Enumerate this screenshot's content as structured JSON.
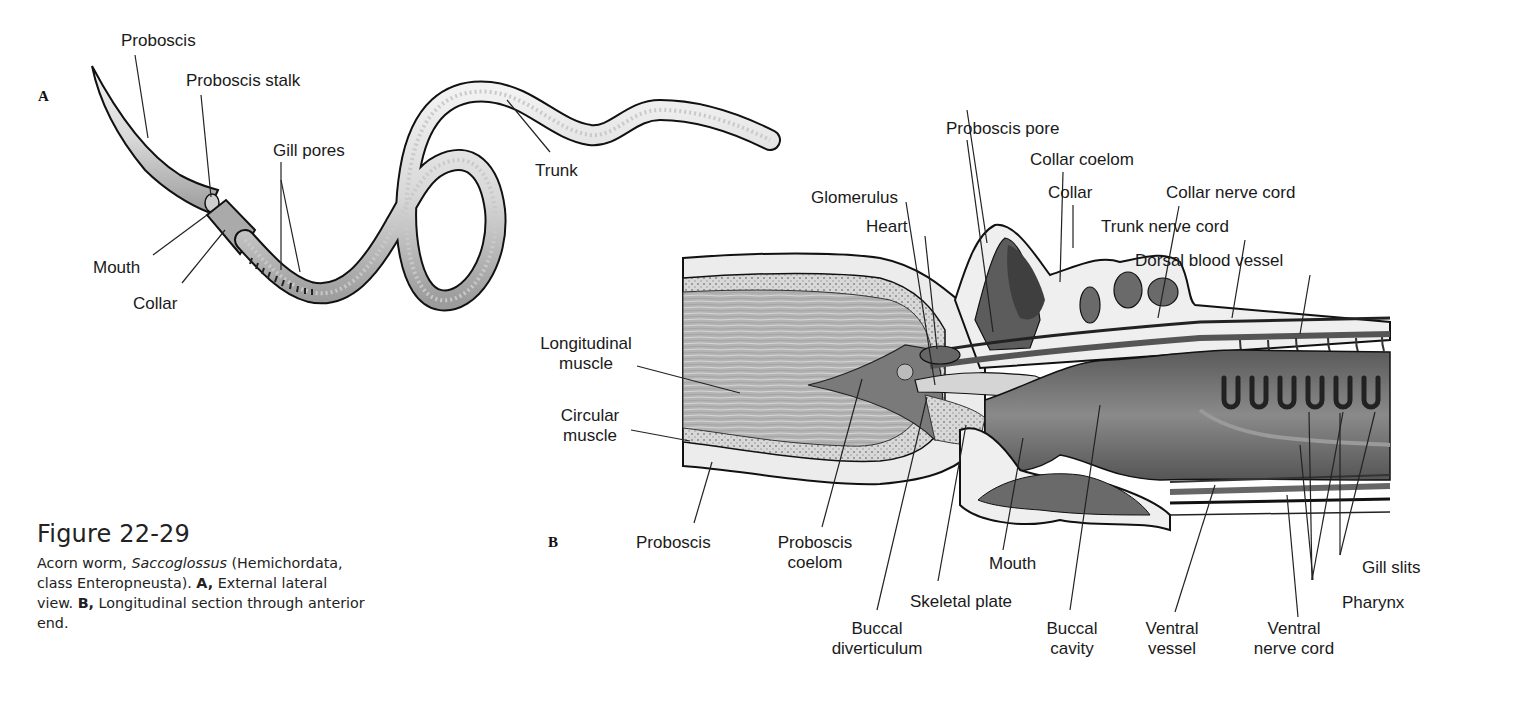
{
  "figure": {
    "number": "Figure 22-29",
    "caption": {
      "lead": "Acorn worm, ",
      "genus": "Saccoglossus",
      "after_genus": " (Hemichordata, class Enteropneusta). ",
      "part_a_marker": "A,",
      "part_a_text": " External lateral view. ",
      "part_b_marker": "B,",
      "part_b_text": " Longitudinal section through anterior end."
    }
  },
  "panel_a": {
    "letter": "A",
    "title": "External lateral view",
    "labels": [
      {
        "id": "proboscis",
        "text": "Proboscis"
      },
      {
        "id": "proboscis-stalk",
        "text": "Proboscis stalk"
      },
      {
        "id": "gill-pores",
        "text": "Gill pores"
      },
      {
        "id": "trunk",
        "text": "Trunk"
      },
      {
        "id": "mouth",
        "text": "Mouth"
      },
      {
        "id": "collar",
        "text": "Collar"
      }
    ]
  },
  "panel_b": {
    "letter": "B",
    "title": "Longitudinal section through anterior end",
    "labels": [
      {
        "id": "proboscis-pore",
        "text": "Proboscis pore"
      },
      {
        "id": "collar-coelom",
        "text": "Collar coelom"
      },
      {
        "id": "glomerulus",
        "text": "Glomerulus"
      },
      {
        "id": "collar",
        "text": "Collar"
      },
      {
        "id": "collar-nerve-cord",
        "text": "Collar nerve cord"
      },
      {
        "id": "heart",
        "text": "Heart"
      },
      {
        "id": "trunk-nerve-cord",
        "text": "Trunk nerve cord"
      },
      {
        "id": "dorsal-blood-vessel",
        "text": "Dorsal blood vessel"
      },
      {
        "id": "longitudinal-muscle",
        "line1": "Longitudinal",
        "line2": "muscle"
      },
      {
        "id": "circular-muscle",
        "line1": "Circular",
        "line2": "muscle"
      },
      {
        "id": "proboscis",
        "text": "Proboscis"
      },
      {
        "id": "proboscis-coelom",
        "line1": "Proboscis",
        "line2": "coelom"
      },
      {
        "id": "mouth",
        "text": "Mouth"
      },
      {
        "id": "skeletal-plate",
        "text": "Skeletal plate"
      },
      {
        "id": "buccal-diverticulum",
        "line1": "Buccal",
        "line2": "diverticulum"
      },
      {
        "id": "buccal-cavity",
        "line1": "Buccal",
        "line2": "cavity"
      },
      {
        "id": "ventral-vessel",
        "line1": "Ventral",
        "line2": "vessel"
      },
      {
        "id": "ventral-nerve-cord",
        "line1": "Ventral",
        "line2": "nerve cord"
      },
      {
        "id": "gill-slits",
        "text": "Gill slits"
      },
      {
        "id": "pharynx",
        "text": "Pharynx"
      }
    ]
  },
  "colors": {
    "background": "#ffffff",
    "ink": "#1a1a1a",
    "body_light": "#e4e4e4",
    "body_mid": "#bdbdbd",
    "tissue_dark": "#6e6e6e",
    "cavity_dark": "#4a4a4a",
    "muscle": "#b0b0b0"
  }
}
